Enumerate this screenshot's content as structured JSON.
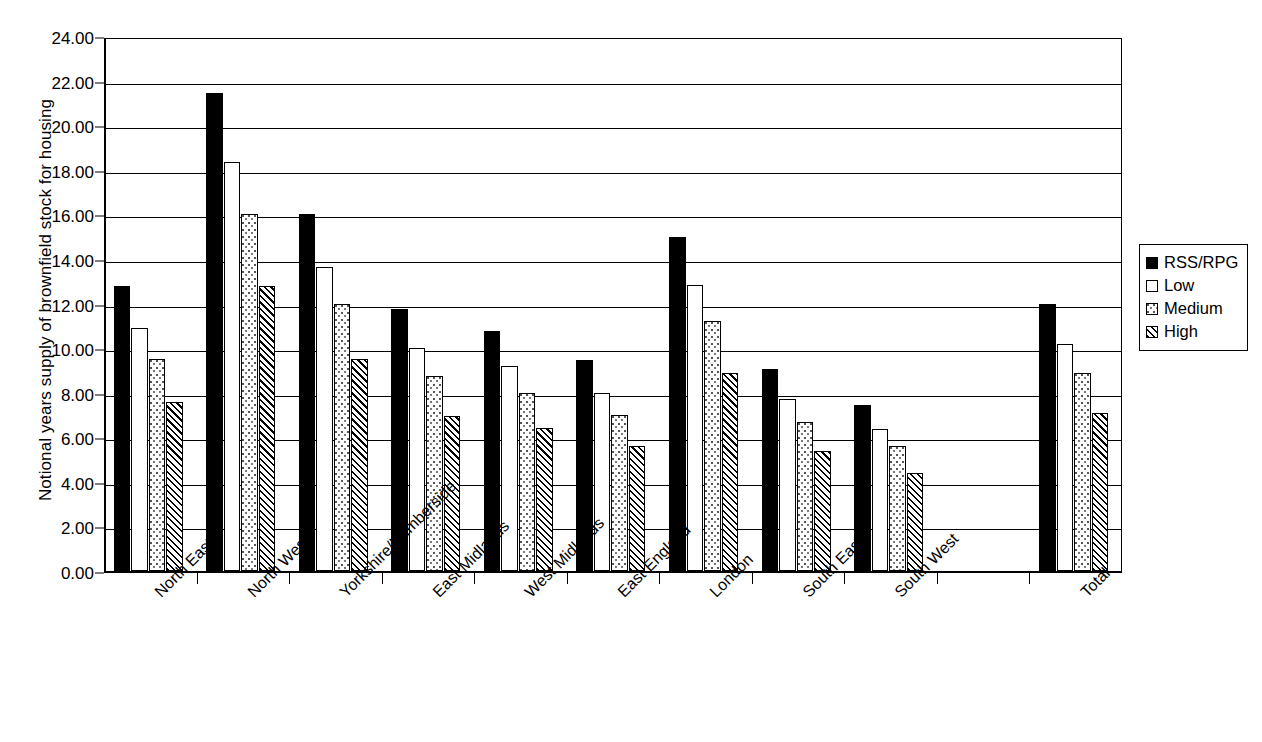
{
  "chart_data": {
    "type": "bar",
    "title": "",
    "xlabel": "",
    "ylabel": "Notional years supply of brownfield stock for housing",
    "ylim": [
      0,
      24
    ],
    "ytick_step": 2,
    "ytick_labels": [
      "0.00",
      "2.00",
      "4.00",
      "6.00",
      "8.00",
      "10.00",
      "12.00",
      "14.00",
      "16.00",
      "18.00",
      "20.00",
      "22.00",
      "24.00"
    ],
    "grid": true,
    "legend_position": "right",
    "categories": [
      "North East",
      "North West",
      "Yorkshire/Humberside",
      "East Midlands",
      "West Midlands",
      "East England",
      "London",
      "South East",
      "South West",
      "",
      "Total"
    ],
    "series": [
      {
        "name": "RSS/RPG",
        "pattern": "solid",
        "values": [
          12.8,
          21.45,
          16.0,
          11.75,
          10.75,
          9.45,
          15.0,
          9.05,
          7.45,
          null,
          12.0
        ]
      },
      {
        "name": "Low",
        "pattern": "empty",
        "values": [
          10.9,
          18.35,
          13.65,
          10.0,
          9.2,
          8.0,
          12.85,
          7.7,
          6.35,
          null,
          10.2
        ]
      },
      {
        "name": "Medium",
        "pattern": "dots",
        "values": [
          9.5,
          16.0,
          12.0,
          8.75,
          8.0,
          7.0,
          11.2,
          6.7,
          5.6,
          null,
          8.9
        ]
      },
      {
        "name": "High",
        "pattern": "hatch",
        "values": [
          7.6,
          12.8,
          9.5,
          6.95,
          6.4,
          5.6,
          8.9,
          5.4,
          4.4,
          null,
          7.1
        ]
      }
    ]
  },
  "legend": {
    "items": [
      {
        "label": "RSS/RPG",
        "pattern": "solid"
      },
      {
        "label": "Low",
        "pattern": "empty"
      },
      {
        "label": "Medium",
        "pattern": "dots"
      },
      {
        "label": "High",
        "pattern": "hatch"
      }
    ]
  },
  "colors": {
    "axis": "#000000",
    "grid": "#000000",
    "background": "#ffffff",
    "series_solid": "#000000",
    "series_empty": "#ffffff"
  }
}
